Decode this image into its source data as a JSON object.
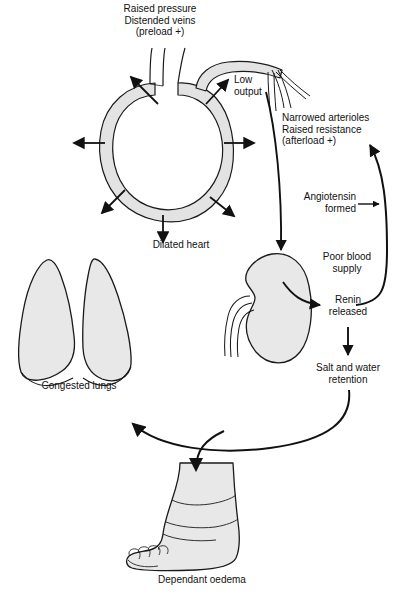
{
  "diagram": {
    "type": "medical-flow-diagram",
    "background_color": "#ffffff",
    "organ_fill_color": "#e8e8e8",
    "organ_stroke_color": "#1a1a1a",
    "arrow_color": "#111111",
    "text_color": "#111111"
  },
  "labels": {
    "raised_pressure": "Raised pressure\nDistended veins\n(preload +)",
    "low_output": "Low\noutput",
    "narrowed_arterioles": "Narrowed arterioles\nRaised resistance\n(afterload +)",
    "angiotensin_formed": "Angiotensin\nformed",
    "dilated_heart": "Dilated heart",
    "poor_blood_supply": "Poor blood\nsupply",
    "renin_released": "Renin\nreleased",
    "salt_and_water": "Salt and water\nretention",
    "congested_lungs": "Congested lungs",
    "dependant_oedema": "Dependant oedema"
  },
  "organs": [
    {
      "name": "dilated-heart",
      "label": "Dilated heart"
    },
    {
      "name": "congested-lungs",
      "label": "Congested lungs"
    },
    {
      "name": "kidney",
      "label": "Poor blood supply"
    },
    {
      "name": "swollen-foot",
      "label": "Dependant oedema"
    }
  ],
  "flow": [
    {
      "from": "Low output",
      "to": "Poor blood supply"
    },
    {
      "from": "Poor blood supply",
      "to": "Renin released"
    },
    {
      "from": "Renin released",
      "to": "Salt and water retention"
    },
    {
      "from": "Renin released",
      "to": "Narrowed arterioles Raised resistance (afterload +)"
    },
    {
      "from": "Angiotensin formed",
      "to": "Narrowed arterioles Raised resistance (afterload +)"
    },
    {
      "from": "Salt and water retention",
      "to": "Congested lungs"
    },
    {
      "from": "Salt and water retention",
      "to": "Dependant oedema"
    }
  ]
}
